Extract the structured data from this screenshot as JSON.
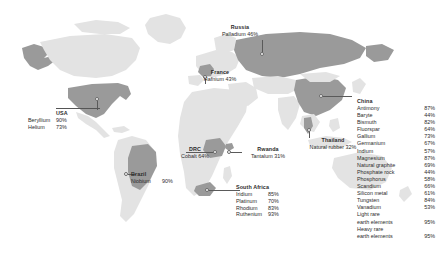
{
  "figure": {
    "type": "map",
    "palette": {
      "background": "#ffffff",
      "land_default": "#e3e3e3",
      "land_highlight": "#9a9a9a",
      "text": "#2b2b2b",
      "marker_fill": "#ffffff",
      "marker_stroke": "#6a6a6a",
      "leader_line": "#5a5a5a"
    }
  },
  "callouts": [
    {
      "id": "usa",
      "country": "USA",
      "items": [
        {
          "material": "Beryllium",
          "share": "90%"
        },
        {
          "material": "Helium",
          "share": "73%"
        }
      ]
    },
    {
      "id": "brazil",
      "country": "Brazil",
      "items": [
        {
          "material": "Niobium",
          "share": "90%"
        }
      ]
    },
    {
      "id": "drc",
      "country": "DRC",
      "items": [
        {
          "material": "Cobalt",
          "share": "64%"
        }
      ]
    },
    {
      "id": "rwanda",
      "country": "Rwanda",
      "items": [
        {
          "material": "Tantalum",
          "share": "31%"
        }
      ]
    },
    {
      "id": "france",
      "country": "France",
      "items": [
        {
          "material": "Hafnium",
          "share": "43%"
        }
      ]
    },
    {
      "id": "russia",
      "country": "Russia",
      "items": [
        {
          "material": "Palladium",
          "share": "46%"
        }
      ]
    },
    {
      "id": "thailand",
      "country": "Thailand",
      "items": [
        {
          "material": "Natural rubber",
          "share": "32%"
        }
      ]
    },
    {
      "id": "southafrica",
      "country": "South Africa",
      "items": [
        {
          "material": "Iridium",
          "share": "85%"
        },
        {
          "material": "Platinum",
          "share": "70%"
        },
        {
          "material": "Rhodium",
          "share": "83%"
        },
        {
          "material": "Ruthenium",
          "share": "93%"
        }
      ]
    },
    {
      "id": "china",
      "country": "China",
      "items": [
        {
          "material": "Antimony",
          "share": "87%"
        },
        {
          "material": "Baryte",
          "share": "44%"
        },
        {
          "material": "Bismuth",
          "share": "82%"
        },
        {
          "material": "Fluorspar",
          "share": "64%"
        },
        {
          "material": "Gallium",
          "share": "73%"
        },
        {
          "material": "Germanium",
          "share": "67%"
        },
        {
          "material": "Indium",
          "share": "57%"
        },
        {
          "material": "Magnesium",
          "share": "87%"
        },
        {
          "material": "Natural graphite",
          "share": "69%"
        },
        {
          "material": "Phosphate rock",
          "share": "44%"
        },
        {
          "material": "Phosphorus",
          "share": "58%"
        },
        {
          "material": "Scandium",
          "share": "66%"
        },
        {
          "material": "Silicon metal",
          "share": "61%"
        },
        {
          "material": "Tungsten",
          "share": "84%"
        },
        {
          "material": "Vanadium",
          "share": "53%"
        },
        {
          "material": "Light rare earth elements",
          "share": "95%"
        },
        {
          "material": "Heavy rare earth elements",
          "share": "95%"
        }
      ]
    }
  ]
}
